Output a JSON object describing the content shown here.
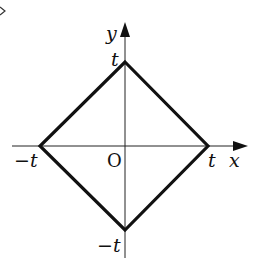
{
  "diagram": {
    "type": "coordinate-plane-square",
    "axes": {
      "x_label": "x",
      "y_label": "y",
      "origin_label": "O"
    },
    "tick_labels": {
      "x_positive": "t",
      "x_negative": "−t",
      "y_positive": "t",
      "y_negative": "−t"
    },
    "shape": {
      "kind": "square rotated 45°",
      "vertices": [
        [
          "t",
          "0"
        ],
        [
          "0",
          "t"
        ],
        [
          "−t",
          "0"
        ],
        [
          "0",
          "−t"
        ]
      ]
    },
    "corner_fragment": "‹",
    "colors": {
      "ink": "#111111",
      "background": "#ffffff"
    }
  }
}
